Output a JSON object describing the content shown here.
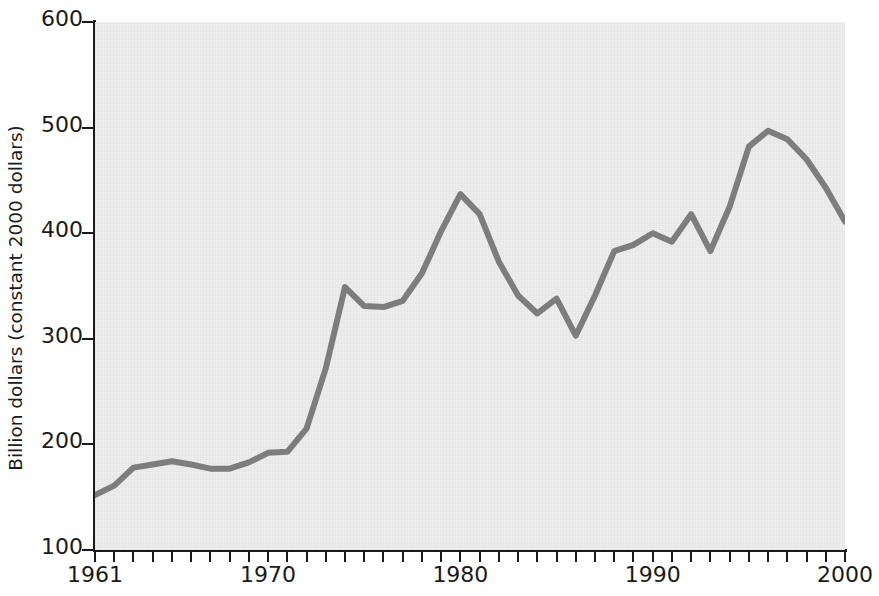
{
  "chart_data": {
    "type": "line",
    "title": "",
    "xlabel": "",
    "ylabel": "Billion dollars (constant 2000 dollars)",
    "xlim": [
      1961,
      2000
    ],
    "ylim": [
      100,
      600
    ],
    "grid": false,
    "legend": null,
    "line_color": "#7d7d7d",
    "plot_background": "#eeeeee",
    "axis_color": "#1a1a1a",
    "ytick_labels": [
      "600",
      "500",
      "400",
      "300",
      "200",
      "100"
    ],
    "ytick_values": [
      600,
      500,
      400,
      300,
      200,
      100
    ],
    "xtick_labels": [
      "1961",
      "1970",
      "1980",
      "1990",
      "2000"
    ],
    "xtick_values": [
      1961,
      1970,
      1980,
      1990,
      2000
    ],
    "x": [
      1961,
      1962,
      1963,
      1964,
      1965,
      1966,
      1967,
      1968,
      1969,
      1970,
      1971,
      1972,
      1973,
      1974,
      1975,
      1976,
      1977,
      1978,
      1979,
      1980,
      1981,
      1982,
      1983,
      1984,
      1985,
      1986,
      1987,
      1988,
      1989,
      1990,
      1991,
      1992,
      1993,
      1994,
      1995,
      1996,
      1997,
      1998,
      1999,
      2000
    ],
    "values": [
      152,
      161,
      178,
      181,
      184,
      181,
      177,
      177,
      183,
      192,
      193,
      215,
      272,
      349,
      331,
      330,
      336,
      362,
      402,
      437,
      418,
      373,
      341,
      324,
      338,
      303,
      341,
      383,
      389,
      400,
      392,
      418,
      383,
      425,
      482,
      497,
      489,
      470,
      443,
      411
    ]
  },
  "figure": {
    "size_px": [
      879,
      596
    ]
  }
}
